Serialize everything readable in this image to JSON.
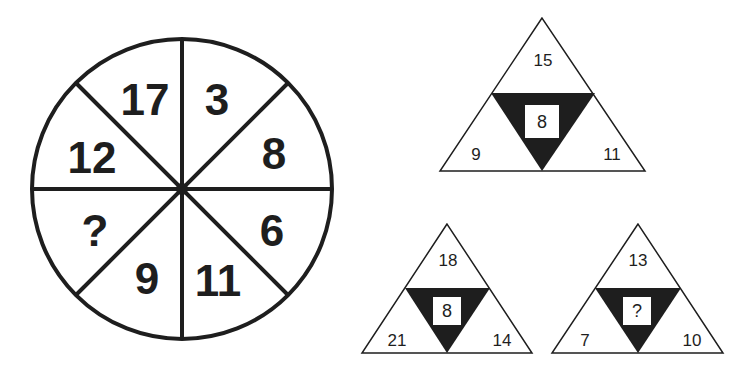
{
  "puzzle": {
    "wheel": {
      "segments": [
        {
          "position": "top-left",
          "value": "17"
        },
        {
          "position": "top-right",
          "value": "3"
        },
        {
          "position": "right-top",
          "value": "8"
        },
        {
          "position": "right-bottom",
          "value": "6"
        },
        {
          "position": "bottom-right",
          "value": "11"
        },
        {
          "position": "bottom-left",
          "value": "9"
        },
        {
          "position": "left-bottom",
          "value": "?"
        },
        {
          "position": "left-top",
          "value": "12"
        }
      ]
    },
    "triangles": [
      {
        "top": "15",
        "left": "9",
        "right": "11",
        "center": "8"
      },
      {
        "top": "18",
        "left": "21",
        "right": "14",
        "center": "8"
      },
      {
        "top": "13",
        "left": "7",
        "right": "10",
        "center": "?"
      }
    ],
    "colors": {
      "ink": "#1e1e1e",
      "background": "#ffffff"
    }
  }
}
